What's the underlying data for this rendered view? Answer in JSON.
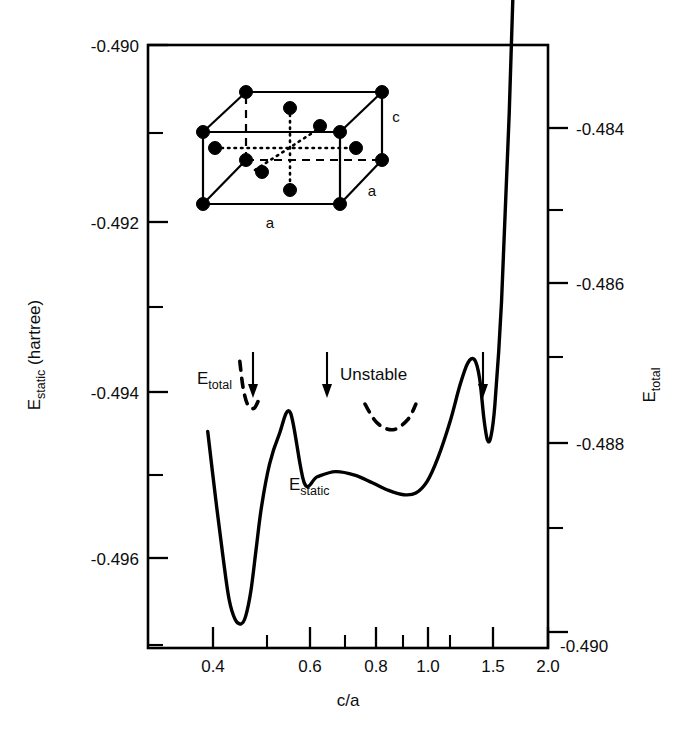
{
  "figure": {
    "left_axis_title": "E",
    "left_axis_title_sub": "static",
    "left_axis_title_unit": " (hartree)",
    "right_axis_title": "E",
    "right_axis_title_sub": "total",
    "x_axis_title": "c/a"
  },
  "labels": {
    "e_total": "E",
    "e_total_sub": "total",
    "e_static": "E",
    "e_static_sub": "static",
    "unstable": "Unstable",
    "inset_a_bottom": "a",
    "inset_a_right": "a",
    "inset_c": "c"
  },
  "chart_data": {
    "type": "line",
    "title": "",
    "xlabel": "c/a",
    "ylabel": "E_static (hartree)",
    "y2label": "E_total",
    "xscale": "log",
    "xlim": [
      0.345,
      2.0
    ],
    "ylim": [
      -0.49705,
      -0.49
    ],
    "y2lim": [
      -0.49,
      -0.48317
    ],
    "grid": false,
    "legend": "none",
    "x_ticks_major": [
      0.4,
      0.6,
      0.8,
      1.0,
      1.5,
      2.0
    ],
    "x_tick_labels": [
      "0.4",
      "0.6",
      "0.8",
      "1.0",
      "1.5",
      "2.0"
    ],
    "x_ticks_minor": [
      0.5,
      0.7,
      0.9,
      1.1
    ],
    "y_ticks_major": [
      -0.49,
      -0.492,
      -0.494,
      -0.496
    ],
    "y_tick_labels": [
      "-0.490",
      "-0.492",
      "-0.494",
      "-0.496"
    ],
    "y_ticks_minor": [
      -0.491,
      -0.493,
      -0.495,
      -0.497
    ],
    "y2_ticks_major": [
      -0.484,
      -0.486,
      -0.488,
      -0.49
    ],
    "y2_tick_labels": [
      "-0.484",
      "-0.486",
      "-0.488",
      "-0.490"
    ],
    "y2_ticks_minor": [
      -0.485,
      -0.487,
      -0.489
    ],
    "series": [
      {
        "name": "E_static",
        "style": "solid",
        "points": [
          [
            0.39,
            -0.49452
          ],
          [
            0.405,
            -0.4953
          ],
          [
            0.42,
            -0.496
          ],
          [
            0.432,
            -0.49648
          ],
          [
            0.445,
            -0.49672
          ],
          [
            0.458,
            -0.49677
          ],
          [
            0.468,
            -0.49668
          ],
          [
            0.48,
            -0.49638
          ],
          [
            0.492,
            -0.4959
          ],
          [
            0.505,
            -0.4954
          ],
          [
            0.525,
            -0.4949
          ],
          [
            0.55,
            -0.49455
          ],
          [
            0.58,
            -0.4943
          ],
          [
            0.62,
            -0.49512
          ],
          [
            0.66,
            -0.49505
          ],
          [
            0.72,
            -0.49499
          ],
          [
            0.79,
            -0.49503
          ],
          [
            0.86,
            -0.49512
          ],
          [
            0.93,
            -0.49521
          ],
          [
            1.0,
            -0.49526
          ],
          [
            1.06,
            -0.49524
          ],
          [
            1.12,
            -0.4951
          ],
          [
            1.18,
            -0.49482
          ],
          [
            1.25,
            -0.4944
          ],
          [
            1.31,
            -0.49398
          ],
          [
            1.36,
            -0.49372
          ],
          [
            1.405,
            -0.49368
          ],
          [
            1.44,
            -0.4939
          ],
          [
            1.47,
            -0.49437
          ],
          [
            1.495,
            -0.49462
          ],
          [
            1.52,
            -0.49458
          ],
          [
            1.55,
            -0.4942
          ],
          [
            1.6,
            -0.493
          ],
          [
            1.66,
            -0.4908
          ],
          [
            1.73,
            -0.4876
          ],
          [
            1.8,
            -0.485
          ],
          [
            1.86,
            -0.4837
          ],
          [
            1.9,
            -0.4833
          ]
        ]
      },
      {
        "name": "E_total_segment_left",
        "style": "dashed",
        "points": [
          [
            0.455,
            -0.4937
          ],
          [
            0.462,
            -0.494
          ],
          [
            0.472,
            -0.4942
          ],
          [
            0.487,
            -0.49425
          ],
          [
            0.5,
            -0.49413
          ]
        ]
      },
      {
        "name": "E_total_segment_right",
        "style": "dashed",
        "points": [
          [
            0.83,
            -0.4942
          ],
          [
            0.88,
            -0.49442
          ],
          [
            0.95,
            -0.4945
          ],
          [
            1.02,
            -0.49438
          ],
          [
            1.06,
            -0.4942
          ]
        ]
      }
    ],
    "annotations": [
      {
        "text": "E_total",
        "x": 0.435,
        "y": -0.49345,
        "kind": "curve-label"
      },
      {
        "text": "E_static",
        "x": 0.705,
        "y": -0.49545,
        "kind": "curve-label"
      },
      {
        "text": "Unstable",
        "x": 0.8,
        "y": -0.49345,
        "kind": "region-label"
      },
      {
        "kind": "arrow",
        "x": 0.5,
        "y_from": -0.4933,
        "y_to": -0.49435
      },
      {
        "kind": "arrow",
        "x": 0.7,
        "y_from": -0.4933,
        "y_to": -0.49435
      },
      {
        "kind": "arrow",
        "x": 1.5,
        "y_from": -0.4933,
        "y_to": -0.49435
      }
    ]
  },
  "inset": {
    "name": "body-centered-tetragonal-unit-cell",
    "corner_atoms": 8,
    "interior_atoms": 6,
    "edge_labels": [
      "a",
      "a",
      "c"
    ]
  }
}
